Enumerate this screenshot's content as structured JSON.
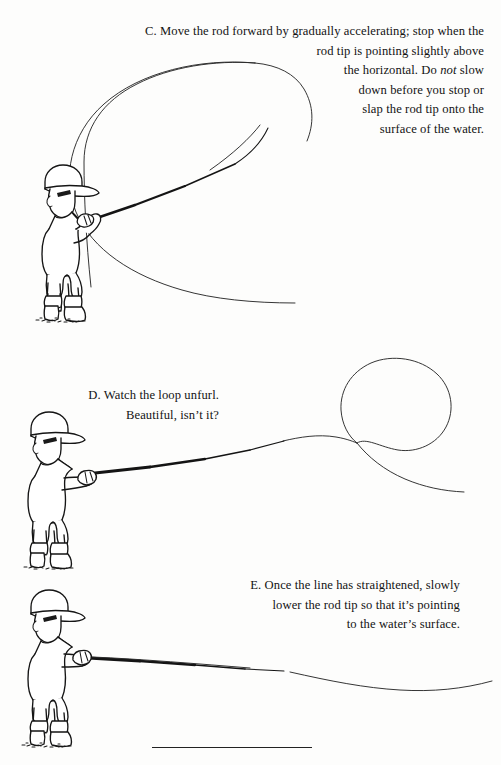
{
  "page": {
    "background": "#fdfdfc",
    "ink": "#1a1a1a",
    "width": 501,
    "height": 765
  },
  "captions": {
    "c": {
      "label": "C.",
      "line1": "C. Move the rod forward by gradually accelerating; stop when the",
      "line2": "rod tip is pointing slightly above",
      "line3_pre": "the horizontal. Do ",
      "line3_em": "not",
      "line3_post": " slow",
      "line4": "down before you stop or",
      "line5": "slap the rod tip onto the",
      "line6": "surface of the water.",
      "full_text": "C. Move the rod forward by gradually accelerating; stop when the rod tip is pointing slightly above the horizontal. Do not slow down before you stop or slap the rod tip onto the surface of the water."
    },
    "d": {
      "label": "D.",
      "line1": "D. Watch the loop unfurl.",
      "line2": "Beautiful, isn’t it?",
      "full_text": "D. Watch the loop unfurl. Beautiful, isn’t it?"
    },
    "e": {
      "label": "E.",
      "line1": "E. Once the line has straightened, slowly",
      "line2": "lower the rod tip so that it’s pointing",
      "line3": "to the water’s surface.",
      "full_text": "E. Once the line has straightened, slowly lower the rod tip so that it’s pointing to the water’s surface."
    }
  },
  "figures": {
    "c": {
      "name": "figure-c-angler-forward-cast",
      "description": "Boy in cap and boots holding fly rod angled up-right; large open fly line loop sweeping left and around."
    },
    "d": {
      "name": "figure-d-angler-loop-unfurling",
      "description": "Boy holding rod horizontally forward; fly line forms a round unfurling loop to the right."
    },
    "e": {
      "name": "figure-e-angler-rod-lowered",
      "description": "Boy with rod lowered toward water; fly line straightened out to the right."
    }
  },
  "footer": {
    "rule": "horizontal-rule"
  }
}
